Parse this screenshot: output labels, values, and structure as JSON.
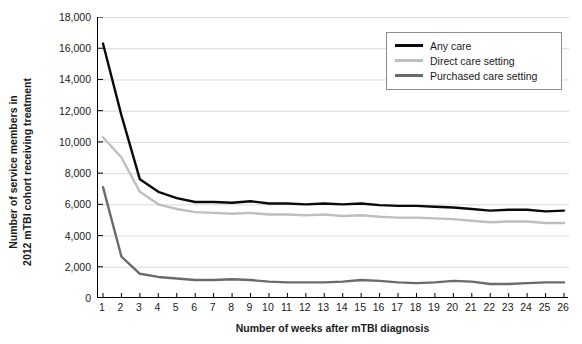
{
  "chart_data": {
    "type": "line",
    "title": "",
    "xlabel": "Number of weeks after mTBI diagnosis",
    "ylabel": "Number of service members in 2012 mTBI cohort receiving treatment",
    "ylabel_lines": [
      "Number of service members in",
      "2012 mTBI cohort receiving treatment"
    ],
    "xlim": [
      1,
      26
    ],
    "ylim": [
      0,
      18000
    ],
    "ytick_step": 2000,
    "grid": "horizontal",
    "legend_position": "top-right",
    "x": [
      1,
      2,
      3,
      4,
      5,
      6,
      7,
      8,
      9,
      10,
      11,
      12,
      13,
      14,
      15,
      16,
      17,
      18,
      19,
      20,
      21,
      22,
      23,
      24,
      25,
      26
    ],
    "categories": [
      "1",
      "2",
      "3",
      "4",
      "5",
      "6",
      "7",
      "8",
      "9",
      "10",
      "11",
      "12",
      "13",
      "14",
      "15",
      "16",
      "17",
      "18",
      "19",
      "20",
      "21",
      "22",
      "23",
      "24",
      "25",
      "26"
    ],
    "ytick_labels": [
      "18,000",
      "16,000",
      "14,000",
      "12,000",
      "10,000",
      "8,000",
      "6,000",
      "4,000",
      "2,000",
      "0"
    ],
    "ytick_values": [
      18000,
      16000,
      14000,
      12000,
      10000,
      8000,
      6000,
      4000,
      2000,
      0
    ],
    "series": [
      {
        "name": "Any care",
        "color": "#0a0a0a",
        "width": 2.4,
        "values": [
          16300,
          11700,
          7600,
          6800,
          6400,
          6150,
          6150,
          6100,
          6200,
          6050,
          6050,
          6000,
          6050,
          6000,
          6050,
          5950,
          5900,
          5900,
          5850,
          5800,
          5700,
          5600,
          5650,
          5650,
          5550,
          5600
        ]
      },
      {
        "name": "Direct care setting",
        "color": "#bfbfbf",
        "width": 2.4,
        "values": [
          10300,
          9000,
          6800,
          6000,
          5700,
          5500,
          5450,
          5400,
          5450,
          5350,
          5350,
          5300,
          5350,
          5250,
          5300,
          5200,
          5150,
          5150,
          5100,
          5050,
          4950,
          4850,
          4900,
          4900,
          4800,
          4800
        ]
      },
      {
        "name": "Purchased care setting",
        "color": "#6b6b6b",
        "width": 2.4,
        "values": [
          7100,
          2650,
          1550,
          1350,
          1250,
          1150,
          1150,
          1200,
          1150,
          1050,
          1000,
          1000,
          1000,
          1050,
          1150,
          1100,
          1000,
          950,
          1000,
          1100,
          1050,
          900,
          900,
          950,
          1000,
          1000
        ]
      }
    ]
  },
  "legend": {
    "items": [
      {
        "label": "Any care",
        "color": "#0a0a0a"
      },
      {
        "label": "Direct care setting",
        "color": "#bfbfbf"
      },
      {
        "label": "Purchased care setting",
        "color": "#6b6b6b"
      }
    ]
  },
  "axes": {
    "axis_color": "#000000",
    "grid_color": "#d9d9d9",
    "text_color": "#1a1a1a"
  }
}
